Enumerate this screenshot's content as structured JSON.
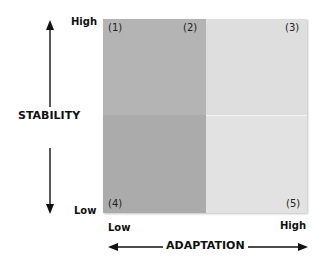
{
  "diagram": {
    "y_axis": {
      "title": "STABILITY",
      "high_label": "High",
      "low_label": "Low"
    },
    "x_axis": {
      "title": "ADAPTATION",
      "low_label": "Low",
      "high_label": "High"
    },
    "quadrant_labels": {
      "q1": "(1)",
      "q2": "(2)",
      "q3": "(3)",
      "q4": "(4)",
      "q5": "(5)"
    },
    "colors": {
      "dark_quadrant": "#b4b4b4",
      "light_quadrant": "#dedede"
    }
  }
}
